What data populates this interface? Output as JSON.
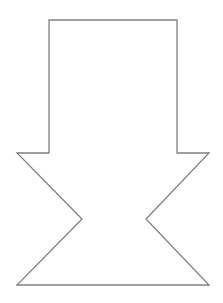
{
  "diagram": {
    "shape": "down-arrow-hourglass-outline",
    "stroke_color": "#808080",
    "fill_color": "#ffffff",
    "stroke_width": 1.3,
    "points": [
      [
        49,
        20
      ],
      [
        177,
        20
      ],
      [
        177,
        153
      ],
      [
        209,
        153
      ],
      [
        146,
        219
      ],
      [
        209,
        285
      ],
      [
        17,
        285
      ],
      [
        82,
        219
      ],
      [
        17,
        153
      ],
      [
        49,
        153
      ]
    ]
  }
}
